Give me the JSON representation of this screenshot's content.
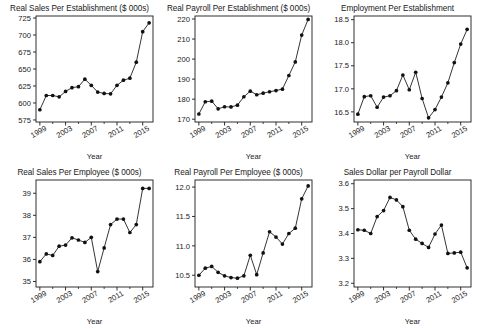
{
  "figure": {
    "layout": "2 rows x 3 columns of line charts",
    "shared_xlabel": "Year",
    "x_tick_labels": [
      "1999",
      "2003",
      "2007",
      "2011",
      "2015"
    ],
    "x_tick_values": [
      1999,
      2003,
      2007,
      2011,
      2015
    ],
    "x_minor_tick_values": [
      2001,
      2005,
      2009,
      2013
    ],
    "years": [
      1999,
      2000,
      2001,
      2002,
      2003,
      2004,
      2005,
      2006,
      2007,
      2008,
      2009,
      2010,
      2011,
      2012,
      2013,
      2014,
      2015,
      2016
    ]
  },
  "chart_data": [
    {
      "type": "line",
      "title": "Real Sales Per Establishment ($ 000s)",
      "xlabel": "Year",
      "ylabel": "",
      "grid": false,
      "legend": "none",
      "xlim": [
        1998.4,
        2016.6
      ],
      "ylim": [
        572,
        728
      ],
      "yticks": [
        575,
        600,
        625,
        650,
        675,
        700,
        725
      ],
      "ytick_labels": [
        "575",
        "600",
        "625",
        "650",
        "675",
        "700",
        "725"
      ],
      "x": [
        1999,
        2000,
        2001,
        2002,
        2003,
        2004,
        2005,
        2006,
        2007,
        2008,
        2009,
        2010,
        2011,
        2012,
        2013,
        2014,
        2015,
        2016
      ],
      "values": [
        590,
        611,
        611,
        609,
        617,
        622.5,
        624,
        635,
        626,
        616,
        614,
        613.5,
        626,
        633.5,
        636.5,
        660,
        705,
        718,
        718
      ]
    },
    {
      "type": "line",
      "title": "Real Payroll Per Establishment ($ 000s)",
      "xlabel": "Year",
      "ylabel": "",
      "grid": false,
      "legend": "none",
      "xlim": [
        1998.4,
        2016.6
      ],
      "ylim": [
        168.6,
        221.5
      ],
      "yticks": [
        170,
        180,
        190,
        200,
        210,
        220
      ],
      "ytick_labels": [
        "170",
        "180",
        "190",
        "200",
        "210",
        "220"
      ],
      "x": [
        1999,
        2000,
        2001,
        2002,
        2003,
        2004,
        2005,
        2006,
        2007,
        2008,
        2009,
        2010,
        2011,
        2012,
        2013,
        2014,
        2015,
        2016
      ],
      "values": [
        172.6,
        178.7,
        179.0,
        175.2,
        176.2,
        176.1,
        177.0,
        181.2,
        184.0,
        182.2,
        183.0,
        183.7,
        184.3,
        185.0,
        191.8,
        198.6,
        212.0,
        219.8,
        219.5
      ]
    },
    {
      "type": "line",
      "title": "Employment Per Establishment",
      "xlabel": "Year",
      "ylabel": "",
      "grid": false,
      "legend": "none",
      "xlim": [
        1998.4,
        2016.6
      ],
      "ylim": [
        16.28,
        18.58
      ],
      "yticks": [
        16.5,
        17.0,
        17.5,
        18.0,
        18.5
      ],
      "ytick_labels": [
        "16.5",
        "17.0",
        "17.5",
        "18.0",
        "18.5"
      ],
      "x": [
        1999,
        2000,
        2001,
        2002,
        2003,
        2004,
        2005,
        2006,
        2007,
        2008,
        2009,
        2010,
        2011,
        2012,
        2013,
        2014,
        2015,
        2016
      ],
      "values": [
        16.45,
        16.83,
        16.85,
        16.6,
        16.82,
        16.85,
        16.96,
        17.3,
        16.98,
        17.36,
        16.79,
        16.37,
        16.55,
        16.82,
        17.13,
        17.57,
        17.97,
        18.29,
        18.2
      ]
    },
    {
      "type": "line",
      "title": "Real Sales Per Employee ($ 000s)",
      "xlabel": "Year",
      "ylabel": "",
      "grid": false,
      "legend": "none",
      "xlim": [
        1998.4,
        2016.6
      ],
      "ylim": [
        34.75,
        39.6
      ],
      "yticks": [
        35,
        36,
        37,
        38,
        39
      ],
      "ytick_labels": [
        "35",
        "36",
        "37",
        "38",
        "39"
      ],
      "x": [
        1999,
        2000,
        2001,
        2002,
        2003,
        2004,
        2005,
        2006,
        2007,
        2008,
        2009,
        2010,
        2011,
        2012,
        2013,
        2014,
        2015,
        2016
      ],
      "values": [
        35.9,
        36.25,
        36.18,
        36.6,
        36.65,
        36.98,
        36.88,
        36.77,
        37.0,
        35.45,
        36.52,
        37.58,
        37.83,
        37.83,
        37.22,
        37.58,
        39.22,
        39.22,
        39.4
      ]
    },
    {
      "type": "line",
      "title": "Real Payroll Per Employee ($ 000s)",
      "xlabel": "Year",
      "ylabel": "",
      "grid": false,
      "legend": "none",
      "xlim": [
        1998.4,
        2016.6
      ],
      "ylim": [
        10.3,
        12.12
      ],
      "yticks": [
        10.5,
        11.0,
        11.5,
        12.0
      ],
      "ytick_labels": [
        "10.5",
        "11.0",
        "11.5",
        "12.0"
      ],
      "x": [
        1999,
        2000,
        2001,
        2002,
        2003,
        2004,
        2005,
        2006,
        2007,
        2008,
        2009,
        2010,
        2011,
        2012,
        2013,
        2014,
        2015,
        2016
      ],
      "values": [
        10.5,
        10.62,
        10.65,
        10.55,
        10.49,
        10.46,
        10.45,
        10.49,
        10.84,
        10.51,
        10.88,
        11.24,
        11.15,
        11.03,
        11.21,
        11.3,
        11.8,
        12.02,
        12.03
      ]
    },
    {
      "type": "line",
      "title": "Sales Dollar per Payroll Dollar",
      "xlabel": "Year",
      "ylabel": "",
      "grid": false,
      "legend": "none",
      "xlim": [
        1998.4,
        2016.6
      ],
      "ylim": [
        3.185,
        3.615
      ],
      "yticks": [
        3.2,
        3.3,
        3.4,
        3.5,
        3.6
      ],
      "ytick_labels": [
        "3.2",
        "3.3",
        "3.4",
        "3.5",
        "3.6"
      ],
      "x": [
        1999,
        2000,
        2001,
        2002,
        2003,
        2004,
        2005,
        2006,
        2007,
        2008,
        2009,
        2010,
        2011,
        2012,
        2013,
        2014,
        2015,
        2016
      ],
      "values": [
        3.415,
        3.413,
        3.4,
        3.468,
        3.492,
        3.545,
        3.535,
        3.508,
        3.413,
        3.377,
        3.36,
        3.344,
        3.398,
        3.434,
        3.32,
        3.322,
        3.325,
        3.262,
        3.277
      ]
    }
  ]
}
